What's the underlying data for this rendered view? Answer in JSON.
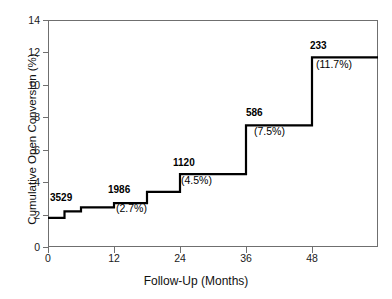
{
  "chart_data": {
    "type": "line",
    "subtype": "step-cumulative-incidence",
    "title": "",
    "xlabel": "Follow-Up (Months)",
    "ylabel": "Cumulative Open Conversion (%)",
    "xlim": [
      0,
      60
    ],
    "ylim": [
      0,
      14
    ],
    "xticks": [
      0,
      12,
      24,
      36,
      48
    ],
    "yticks": [
      0,
      2,
      4,
      6,
      8,
      10,
      12,
      14
    ],
    "xtick_labels": [
      "0",
      "12",
      "24",
      "36",
      "48"
    ],
    "ytick_labels": [
      "0",
      "2",
      "4",
      "6",
      "8",
      "10",
      "12",
      "14"
    ],
    "grid": false,
    "legend": false,
    "line_color": "#000000",
    "frame_color": "#6f6f6f",
    "series": [
      {
        "name": "Cumulative Open Conversion",
        "step": "post",
        "x": [
          0,
          3,
          3,
          6,
          6,
          12,
          12,
          18,
          18,
          24,
          24,
          36,
          36,
          48,
          48,
          60
        ],
        "y": [
          1.8,
          1.8,
          2.2,
          2.2,
          2.45,
          2.45,
          2.7,
          2.7,
          3.4,
          3.4,
          4.5,
          4.5,
          7.5,
          7.5,
          11.7,
          11.7
        ]
      }
    ],
    "annotations": [
      {
        "at_risk": "3529",
        "percent": "",
        "x": 0,
        "y": 1.8
      },
      {
        "at_risk": "1986",
        "percent": "(2.7%)",
        "x": 12,
        "y": 2.7
      },
      {
        "at_risk": "1120",
        "percent": "(4.5%)",
        "x": 24,
        "y": 4.5
      },
      {
        "at_risk": "586",
        "percent": "(7.5%)",
        "x": 36,
        "y": 7.5
      },
      {
        "at_risk": "233",
        "percent": "(11.7%)",
        "x": 48,
        "y": 11.7
      }
    ]
  },
  "axes": {
    "y": {
      "label": "Cumulative Open Conversion (%)",
      "ticks": [
        {
          "value": 14,
          "label": "14"
        },
        {
          "value": 12,
          "label": "12"
        },
        {
          "value": 10,
          "label": "10"
        },
        {
          "value": 8,
          "label": "8"
        },
        {
          "value": 6,
          "label": "6"
        },
        {
          "value": 4,
          "label": "4"
        },
        {
          "value": 2,
          "label": "2"
        },
        {
          "value": 0,
          "label": "0"
        }
      ]
    },
    "x": {
      "label": "Follow-Up (Months)",
      "ticks": [
        {
          "value": 0,
          "label": "0"
        },
        {
          "value": 12,
          "label": "12"
        },
        {
          "value": 24,
          "label": "24"
        },
        {
          "value": 36,
          "label": "36"
        },
        {
          "value": 48,
          "label": "48"
        }
      ]
    }
  },
  "labels": {
    "count_3529": "3529",
    "count_1986": "1986",
    "pct_1986": "(2.7%)",
    "count_1120": "1120",
    "pct_1120": "(4.5%)",
    "count_586": "586",
    "pct_586": "(7.5%)",
    "count_233": "233",
    "pct_233": "(11.7%)"
  }
}
